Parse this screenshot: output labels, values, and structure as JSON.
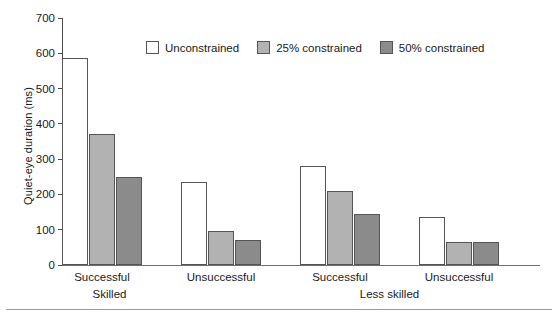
{
  "chart_data": {
    "type": "bar",
    "title": "",
    "xlabel": "",
    "ylabel": "Quiet-eye duration (ms)",
    "ylim": [
      0,
      700
    ],
    "yticks": [
      0,
      100,
      200,
      300,
      400,
      500,
      600,
      700
    ],
    "grid": false,
    "legend_position": "top-center",
    "categories": [
      "Successful",
      "Unsuccessful",
      "Successful",
      "Unsuccessful"
    ],
    "group_labels": [
      "Skilled",
      "Less skilled"
    ],
    "groups": [
      {
        "label": "Skilled",
        "spans": [
          "Successful",
          "Unsuccessful"
        ]
      },
      {
        "label": "Less skilled",
        "spans": [
          "Successful",
          "Unsuccessful"
        ]
      }
    ],
    "series": [
      {
        "name": "Unconstrained",
        "color": "#ffffff",
        "values": [
          588,
          235,
          282,
          137
        ]
      },
      {
        "name": "25% constrained",
        "color": "#b2b2b2",
        "values": [
          370,
          97,
          209,
          64
        ]
      },
      {
        "name": "50% constrained",
        "color": "#8b8b8b",
        "values": [
          249,
          72,
          144,
          64
        ]
      }
    ]
  },
  "axis": {
    "y_title": "Quiet-eye duration (ms)",
    "ticks": [
      "700",
      "600",
      "500",
      "400",
      "300",
      "200",
      "100",
      "0"
    ]
  },
  "legend": {
    "items": [
      {
        "label": "Unconstrained"
      },
      {
        "label": "25% constrained"
      },
      {
        "label": "50% constrained"
      }
    ]
  },
  "xaxis": {
    "tick_labels": [
      "Successful",
      "Unsuccessful",
      "Successful",
      "Unsuccessful"
    ],
    "group_labels": [
      "Skilled",
      "Less skilled"
    ]
  }
}
